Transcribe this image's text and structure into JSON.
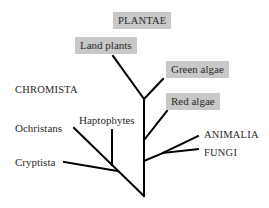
{
  "diagram": {
    "type": "phylogenetic-tree",
    "line_color": "#000000",
    "box_color": "#c8c8c8",
    "labels": {
      "plantae": "PLANTAE",
      "land_plants": "Land plants",
      "green_algae": "Green algae",
      "red_algae": "Red algae",
      "chromista": "CHROMISTA",
      "haptophytes": "Haptophytes",
      "ochristans": "Ochristans",
      "cryptista": "Cryptista",
      "animalia": "ANIMALIA",
      "fungi": "FUNGI"
    },
    "groups": {
      "plantae": [
        "Land plants",
        "Green algae",
        "Red algae"
      ],
      "chromista": [
        "Ochristans",
        "Haptophytes",
        "Cryptista"
      ],
      "other": [
        "ANIMALIA",
        "FUNGI"
      ]
    }
  }
}
